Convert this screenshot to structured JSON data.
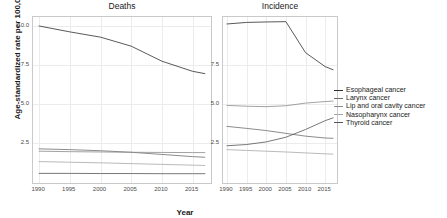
{
  "figure": {
    "ylabel": "Age-standardized rate per 100,000",
    "xlabel": "Year"
  },
  "legend": {
    "position": "right",
    "entries": [
      {
        "label": "Esophageal cancer",
        "color": "#2e2e2e"
      },
      {
        "label": "Larynx cancer",
        "color": "#6e6e6e"
      },
      {
        "label": "Lip and oral cavity cancer",
        "color": "#8a8a8a"
      },
      {
        "label": "Nasopharynx cancer",
        "color": "#a8a8a8"
      },
      {
        "label": "Thyroid cancer",
        "color": "#555555"
      }
    ]
  },
  "chart_data": [
    {
      "type": "line",
      "title": "Deaths",
      "xlabel": "Year",
      "ylabel": "Age-standardized rate per 100,000",
      "x": [
        1990,
        1995,
        2000,
        2005,
        2010,
        2015,
        2017
      ],
      "xlim": [
        1989,
        2018
      ],
      "ylim": [
        -0.1,
        10.6
      ],
      "yticks": [
        2.5,
        5.0,
        7.5,
        10.0
      ],
      "xticks": [
        1990,
        1995,
        2000,
        2005,
        2010,
        2015
      ],
      "grid": true,
      "series": [
        {
          "name": "Esophageal cancer",
          "values": [
            10.02,
            9.64,
            9.3,
            8.72,
            7.75,
            7.1,
            6.95
          ]
        },
        {
          "name": "Larynx cancer",
          "values": [
            2.1,
            2.05,
            1.98,
            1.88,
            1.74,
            1.6,
            1.56
          ]
        },
        {
          "name": "Lip and oral cavity cancer",
          "values": [
            1.95,
            1.92,
            1.9,
            1.88,
            1.87,
            1.86,
            1.86
          ]
        },
        {
          "name": "Nasopharynx cancer",
          "values": [
            1.28,
            1.24,
            1.2,
            1.15,
            1.1,
            1.05,
            1.03
          ]
        },
        {
          "name": "Thyroid cancer",
          "values": [
            0.52,
            0.52,
            0.51,
            0.51,
            0.5,
            0.5,
            0.5
          ]
        }
      ]
    },
    {
      "type": "line",
      "title": "Incidence",
      "xlabel": "Year",
      "ylabel": "Age-standardized rate per 100,000",
      "x": [
        1990,
        1995,
        2000,
        2005,
        2010,
        2015,
        2017
      ],
      "xlim": [
        1989,
        2018
      ],
      "ylim": [
        -0.1,
        10.6
      ],
      "yticks": [
        2.5,
        5.0,
        7.5
      ],
      "xticks": [
        1990,
        1995,
        2000,
        2005,
        2010,
        2015
      ],
      "grid": true,
      "series": [
        {
          "name": "Esophageal cancer",
          "values": [
            10.15,
            10.25,
            10.28,
            10.3,
            8.3,
            7.4,
            7.2
          ]
        },
        {
          "name": "Lip and oral cavity cancer",
          "values": [
            4.9,
            4.85,
            4.82,
            4.88,
            5.05,
            5.15,
            5.18
          ]
        },
        {
          "name": "Larynx cancer",
          "values": [
            3.55,
            3.42,
            3.28,
            3.1,
            2.92,
            2.8,
            2.78
          ]
        },
        {
          "name": "Thyroid cancer",
          "values": [
            2.3,
            2.38,
            2.55,
            2.85,
            3.35,
            3.92,
            4.1
          ]
        },
        {
          "name": "Nasopharynx cancer",
          "values": [
            2.05,
            2.0,
            1.95,
            1.9,
            1.84,
            1.78,
            1.76
          ]
        }
      ]
    }
  ]
}
